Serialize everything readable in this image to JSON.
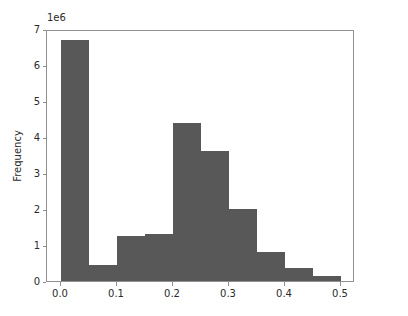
{
  "chart_data": {
    "type": "bar",
    "subtype": "histogram",
    "title": "",
    "xlabel": "",
    "ylabel": "Frequency",
    "y_offset_text": "1e6",
    "y_offset_multiplier": 1000000,
    "bar_color": "#585858",
    "axes_color": "#919191",
    "text_color": "#2b2b2b",
    "background": "#ffffff",
    "grid": false,
    "legend": null,
    "xlim": [
      -0.025,
      0.525
    ],
    "ylim": [
      0,
      7000000
    ],
    "xticks": [
      0.0,
      0.1,
      0.2,
      0.3,
      0.4,
      0.5
    ],
    "xtick_labels": [
      "0.0",
      "0.1",
      "0.2",
      "0.3",
      "0.4",
      "0.5"
    ],
    "yticks": [
      0,
      1000000,
      2000000,
      3000000,
      4000000,
      5000000,
      6000000,
      7000000
    ],
    "ytick_labels": [
      "0",
      "1",
      "2",
      "3",
      "4",
      "5",
      "6",
      "7"
    ],
    "bin_width": 0.05,
    "bin_edges": [
      0.0,
      0.05,
      0.1,
      0.15,
      0.2,
      0.25,
      0.3,
      0.35,
      0.4,
      0.45,
      0.5
    ],
    "bin_centers": [
      0.025,
      0.075,
      0.125,
      0.175,
      0.225,
      0.275,
      0.325,
      0.375,
      0.425,
      0.475
    ],
    "categories": [
      "0.00-0.05",
      "0.05-0.10",
      "0.10-0.15",
      "0.15-0.20",
      "0.20-0.25",
      "0.25-0.30",
      "0.30-0.35",
      "0.35-0.40",
      "0.40-0.45",
      "0.45-0.50"
    ],
    "values": [
      6700000,
      450000,
      1250000,
      1300000,
      4400000,
      3600000,
      2000000,
      800000,
      350000,
      150000
    ],
    "values_scaled_1e6": [
      6.7,
      0.45,
      1.25,
      1.3,
      4.4,
      3.6,
      2.0,
      0.8,
      0.35,
      0.15
    ]
  }
}
